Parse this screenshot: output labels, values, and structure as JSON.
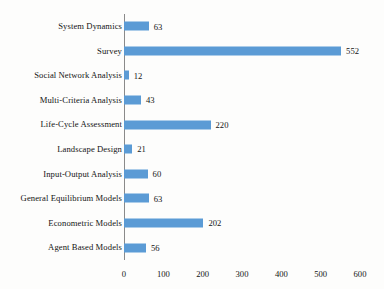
{
  "chart_data": {
    "type": "bar",
    "orientation": "horizontal",
    "title": "",
    "subtitle": "",
    "xlabel": "",
    "ylabel": "",
    "categories": [
      "System Dynamics",
      "Survey",
      "Social Network Analysis",
      "Multi-Criteria Analysis",
      "Life-Cycle Assessment",
      "Landscape Design",
      "Input-Output Analysis",
      "General Equilibrium Models",
      "Econometric Models",
      "Agent Based Models"
    ],
    "values": [
      63,
      552,
      12,
      43,
      220,
      21,
      60,
      63,
      202,
      56
    ],
    "data_labels": [
      "63",
      "552",
      "12",
      "43",
      "220",
      "21",
      "60",
      "63",
      "202",
      "56"
    ],
    "xlim": [
      0,
      600
    ],
    "xticks": [
      0,
      100,
      200,
      300,
      400,
      500,
      600
    ],
    "xtick_labels": [
      "0",
      "100",
      "200",
      "300",
      "400",
      "500",
      "600"
    ],
    "grid": false,
    "legend": null,
    "legend_position": "none",
    "series": [
      {
        "name": "Count",
        "color": "#5B9BD5",
        "values": [
          63,
          552,
          12,
          43,
          220,
          21,
          60,
          63,
          202,
          56
        ]
      }
    ],
    "colors": {
      "bar": "#5B9BD5",
      "axis": "#8A8A8A",
      "text": "#141414",
      "background": "#FDFDFC"
    }
  }
}
